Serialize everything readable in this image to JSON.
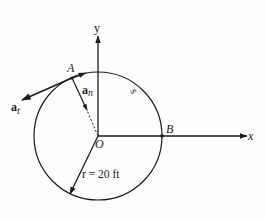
{
  "diagram": {
    "type": "kinematics-circular-motion",
    "axes": {
      "x_label": "x",
      "y_label": "y"
    },
    "origin_label": "O",
    "points": {
      "A": "A",
      "B": "B"
    },
    "vectors": {
      "a_n": {
        "base": "a",
        "sub": "n"
      },
      "a_t": {
        "base": "a",
        "sub": "t"
      }
    },
    "arc_label": "s",
    "radius_label": "r = 20 ft",
    "colors": {
      "ink": "#1a1a1a",
      "background": "#fefefe"
    }
  }
}
